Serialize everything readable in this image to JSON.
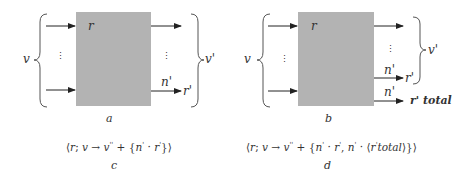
{
  "diagram_a": {
    "input_label": "v",
    "box_label": "r",
    "n_label": "n'",
    "output_r_label": "r'",
    "output_group_label": "v'",
    "caption": "a",
    "vdots_left": "⋮",
    "vdots_right": "⋮"
  },
  "diagram_b": {
    "input_label": "v",
    "box_label": "r",
    "n_label_1": "n'",
    "output_r_label": "r'",
    "n_label_2": "n'",
    "output_total_label": "r' total",
    "output_group_label": "v'",
    "caption": "b",
    "vdots_left": "⋮",
    "vdots_right": "⋮"
  },
  "formula_c": {
    "open": "⟨",
    "r": "r",
    "semi": "; ",
    "v": "v",
    "arrow": " → ",
    "v2": "v",
    "v2_sup": "''",
    "plus": " + {",
    "n": "n",
    "n_sup": "'",
    "dot": " · ",
    "rr": "r",
    "rr_sup": "'",
    "close": "}⟩",
    "caption": "c"
  },
  "formula_d": {
    "open": "⟨",
    "r": "r",
    "semi": "; ",
    "v": "v",
    "arrow": " → ",
    "v2": "v",
    "v2_sup": "''",
    "plus": " + {",
    "n": "n",
    "n_sup": "'",
    "dot": " · ",
    "rr": "r",
    "rr_sup": "'",
    "comma": ", ",
    "n2": "n",
    "n2_sup": "'",
    "dot2": " · ⟨",
    "rt": "r",
    "rt_sup": "'",
    "total": "total",
    "close": "⟩}⟩",
    "caption": "d"
  },
  "colors": {
    "box_fill": "#b3b3b3",
    "stroke": "#222222",
    "brace": "#555555"
  }
}
